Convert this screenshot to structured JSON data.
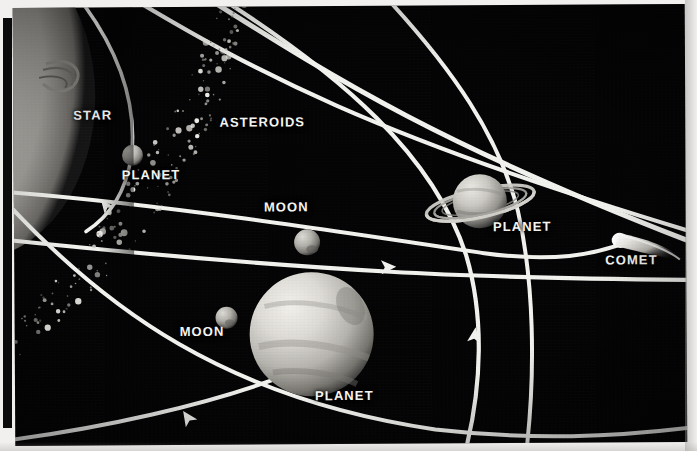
{
  "figure": {
    "background_color": "#050506",
    "line_color": "#f3f3f0",
    "label_color": "#f6f6f4",
    "page_color": "#f2f0ee"
  },
  "labels": [
    {
      "id": "star",
      "text": "STAR",
      "x": 60,
      "y": 107,
      "size": 13
    },
    {
      "id": "asteroids",
      "text": "ASTEROIDS",
      "x": 206,
      "y": 114,
      "size": 13
    },
    {
      "id": "planet-inner",
      "text": "PLANET",
      "x": 108,
      "y": 167,
      "size": 13
    },
    {
      "id": "moon-upper",
      "text": "MOON",
      "x": 250,
      "y": 200,
      "size": 13
    },
    {
      "id": "planet-ringed",
      "text": "PLANET",
      "x": 479,
      "y": 221,
      "size": 13
    },
    {
      "id": "comet",
      "text": "COMET",
      "x": 591,
      "y": 255,
      "size": 13
    },
    {
      "id": "moon-lower",
      "text": "MOON",
      "x": 165,
      "y": 324,
      "size": 13
    },
    {
      "id": "planet-large",
      "text": "PLANET",
      "x": 300,
      "y": 389,
      "size": 13
    }
  ],
  "bodies": {
    "star": {
      "name": "star",
      "kind": "star",
      "cx": -40,
      "cy": 85,
      "rx": 118,
      "ry": 160
    },
    "planet_inner": {
      "name": "inner planet",
      "kind": "planet",
      "cx": 119,
      "cy": 148,
      "r": 10
    },
    "moon_upper": {
      "name": "upper moon",
      "kind": "moon",
      "cx": 293,
      "cy": 236,
      "r": 13
    },
    "moon_lower": {
      "name": "lower moon",
      "kind": "moon",
      "cx": 212,
      "cy": 312,
      "r": 11
    },
    "planet_large": {
      "name": "large planet",
      "kind": "planet",
      "cx": 297,
      "cy": 328,
      "r": 62
    },
    "planet_ringed": {
      "name": "ringed planet",
      "kind": "ringed-planet",
      "cx": 466,
      "cy": 196,
      "r": 28,
      "ring_rx": 55,
      "ring_ry": 15
    },
    "comet": {
      "name": "comet",
      "kind": "comet",
      "cx": 608,
      "cy": 240,
      "tail_length": 48
    }
  },
  "orbits": {
    "count": 6,
    "arrow_markers": 4,
    "asteroid_belt": {
      "name": "asteroid belt",
      "particle_count": 190
    }
  }
}
